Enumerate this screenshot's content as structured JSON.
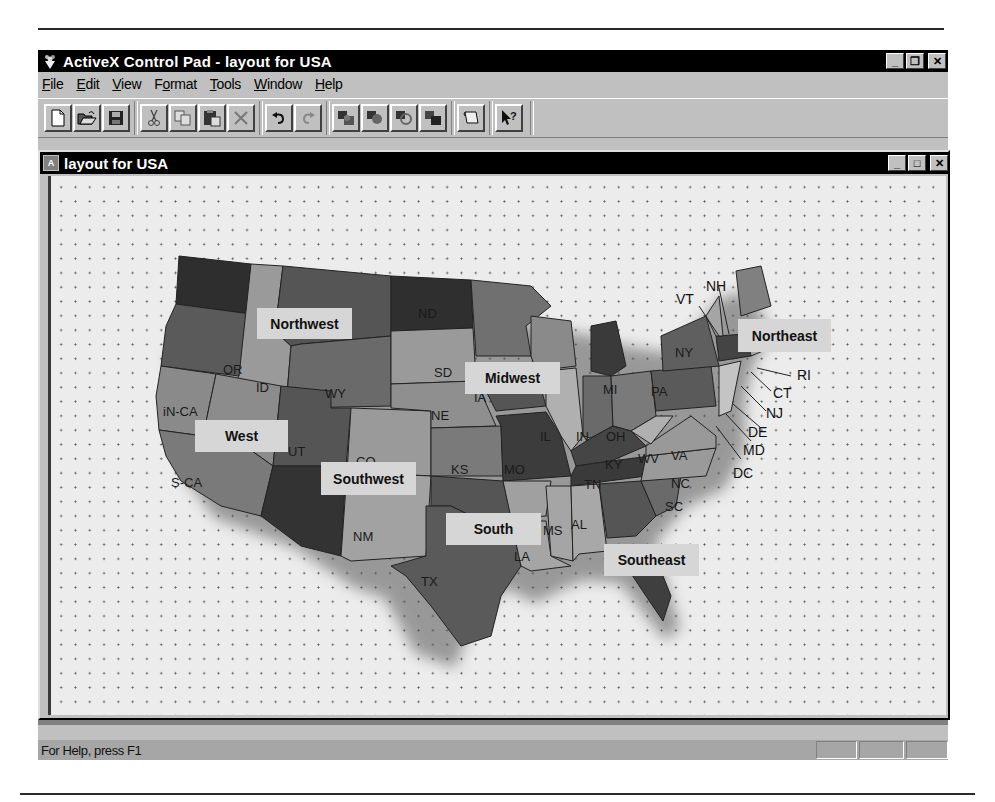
{
  "window": {
    "title": "ActiveX Control Pad - layout for USA",
    "controls": {
      "minimize": "_",
      "restore": "❐",
      "close": "✕"
    }
  },
  "menubar": {
    "items": [
      {
        "label": "File",
        "accel": "F"
      },
      {
        "label": "Edit",
        "accel": "E"
      },
      {
        "label": "View",
        "accel": "V"
      },
      {
        "label": "Format",
        "accel": "o"
      },
      {
        "label": "Tools",
        "accel": "T"
      },
      {
        "label": "Window",
        "accel": "W"
      },
      {
        "label": "Help",
        "accel": "H"
      }
    ]
  },
  "toolbar": {
    "buttons": [
      {
        "name": "new",
        "icon": "new-document-icon"
      },
      {
        "name": "open",
        "icon": "open-folder-icon"
      },
      {
        "name": "save",
        "icon": "save-disk-icon"
      },
      {
        "name": "cut",
        "icon": "scissors-icon"
      },
      {
        "name": "copy",
        "icon": "copy-icon"
      },
      {
        "name": "paste",
        "icon": "paste-icon"
      },
      {
        "name": "delete",
        "icon": "delete-x-icon"
      },
      {
        "name": "undo",
        "icon": "undo-icon"
      },
      {
        "name": "redo",
        "icon": "redo-icon"
      },
      {
        "name": "bring-to-front",
        "icon": "bring-front-icon"
      },
      {
        "name": "move-forward",
        "icon": "move-forward-icon"
      },
      {
        "name": "move-backward",
        "icon": "move-backward-icon"
      },
      {
        "name": "send-to-back",
        "icon": "send-back-icon"
      },
      {
        "name": "script-wizard",
        "icon": "scroll-icon"
      },
      {
        "name": "help",
        "icon": "context-help-icon"
      }
    ]
  },
  "document": {
    "title": "layout for USA",
    "controls": {
      "minimize": "_",
      "maximize": "□",
      "close": "✕"
    }
  },
  "map": {
    "regions": [
      {
        "label": "Northwest"
      },
      {
        "label": "Midwest"
      },
      {
        "label": "Northeast"
      },
      {
        "label": "West"
      },
      {
        "label": "Southwest"
      },
      {
        "label": "South"
      },
      {
        "label": "Southeast"
      }
    ],
    "states": [
      "WA",
      "OR",
      "ID",
      "MT",
      "WY",
      "N-CA",
      "S-CA",
      "NV",
      "UT",
      "AZ",
      "CO",
      "NM",
      "ND",
      "SD",
      "NE",
      "KS",
      "MN",
      "IA",
      "MO",
      "WI",
      "IL",
      "MI",
      "IN",
      "OH",
      "KY",
      "TN",
      "TX",
      "OK",
      "AR",
      "LA",
      "MS",
      "AL",
      "GA",
      "FL",
      "SC",
      "NC",
      "VA",
      "WV",
      "PA",
      "NY",
      "ME"
    ],
    "callouts": [
      "VT",
      "NH",
      "MA",
      "RI",
      "CT",
      "NJ",
      "DE",
      "MD",
      "DC"
    ]
  },
  "statusbar": {
    "text": "For Help, press F1"
  }
}
